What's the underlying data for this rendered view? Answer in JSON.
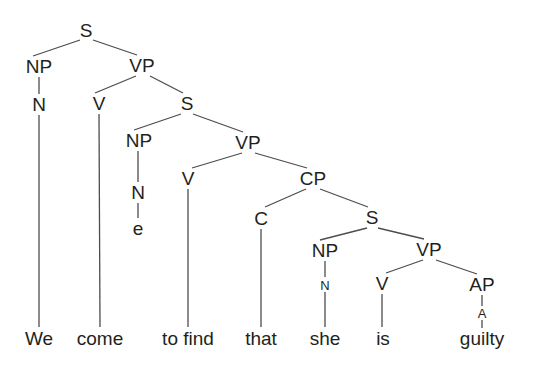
{
  "diagram": {
    "sentence": "We come to find that she is guilty",
    "background_color": "#ffffff",
    "line_color": "#4d4d4d",
    "text_color": "#231f20",
    "width": 534,
    "height": 371,
    "nodes": [
      {
        "id": "s-root",
        "label": "S",
        "x": 86,
        "y": 30,
        "kind": "category"
      },
      {
        "id": "np-1",
        "label": "NP",
        "x": 39,
        "y": 66,
        "kind": "category"
      },
      {
        "id": "vp-1",
        "label": "VP",
        "x": 142,
        "y": 65,
        "kind": "category"
      },
      {
        "id": "n-1",
        "label": "N",
        "x": 39,
        "y": 104,
        "kind": "category"
      },
      {
        "id": "v-1",
        "label": "V",
        "x": 99,
        "y": 103,
        "kind": "category"
      },
      {
        "id": "s-2",
        "label": "S",
        "x": 187,
        "y": 103,
        "kind": "category"
      },
      {
        "id": "np-2",
        "label": "NP",
        "x": 139,
        "y": 140,
        "kind": "category"
      },
      {
        "id": "vp-2",
        "label": "VP",
        "x": 248,
        "y": 142,
        "kind": "category"
      },
      {
        "id": "n-2",
        "label": "N",
        "x": 138,
        "y": 192,
        "kind": "category"
      },
      {
        "id": "v-2",
        "label": "V",
        "x": 188,
        "y": 178,
        "kind": "category"
      },
      {
        "id": "cp-1",
        "label": "CP",
        "x": 313,
        "y": 178,
        "kind": "category"
      },
      {
        "id": "c-1",
        "label": "C",
        "x": 261,
        "y": 218,
        "kind": "category"
      },
      {
        "id": "s-3",
        "label": "S",
        "x": 372,
        "y": 217,
        "kind": "category"
      },
      {
        "id": "np-3",
        "label": "NP",
        "x": 325,
        "y": 250,
        "kind": "category"
      },
      {
        "id": "vp-3",
        "label": "VP",
        "x": 429,
        "y": 249,
        "kind": "category"
      },
      {
        "id": "n-3",
        "label": "N",
        "x": 325,
        "y": 285,
        "kind": "category-small"
      },
      {
        "id": "v-3",
        "label": "V",
        "x": 382,
        "y": 283,
        "kind": "category"
      },
      {
        "id": "ap-1",
        "label": "AP",
        "x": 482,
        "y": 284,
        "kind": "category"
      },
      {
        "id": "a-1",
        "label": "A",
        "x": 482,
        "y": 313,
        "kind": "category-small"
      },
      {
        "id": "leaf-we",
        "label": "We",
        "x": 39,
        "y": 338,
        "kind": "terminal"
      },
      {
        "id": "leaf-come",
        "label": "come",
        "x": 100,
        "y": 338,
        "kind": "terminal"
      },
      {
        "id": "leaf-e",
        "label": "e",
        "x": 138,
        "y": 228,
        "kind": "terminal"
      },
      {
        "id": "leaf-tofind",
        "label": "to find",
        "x": 188,
        "y": 338,
        "kind": "terminal"
      },
      {
        "id": "leaf-that",
        "label": "that",
        "x": 261,
        "y": 338,
        "kind": "terminal"
      },
      {
        "id": "leaf-she",
        "label": "she",
        "x": 325,
        "y": 338,
        "kind": "terminal"
      },
      {
        "id": "leaf-is",
        "label": "is",
        "x": 383,
        "y": 338,
        "kind": "terminal"
      },
      {
        "id": "leaf-guilty",
        "label": "guilty",
        "x": 482,
        "y": 338,
        "kind": "terminal"
      }
    ],
    "edges": [
      {
        "from": "s-root",
        "to": "np-1",
        "x1": 80,
        "y1": 40,
        "x2": 33,
        "y2": 56
      },
      {
        "from": "s-root",
        "to": "vp-1",
        "x1": 93,
        "y1": 40,
        "x2": 137,
        "y2": 55
      },
      {
        "from": "np-1",
        "to": "n-1",
        "x1": 39,
        "y1": 77,
        "x2": 39,
        "y2": 94
      },
      {
        "from": "n-1",
        "to": "leaf-we",
        "x1": 39,
        "y1": 115,
        "x2": 39,
        "y2": 327
      },
      {
        "from": "vp-1",
        "to": "v-1",
        "x1": 136,
        "y1": 76,
        "x2": 95,
        "y2": 93
      },
      {
        "from": "vp-1",
        "to": "s-2",
        "x1": 150,
        "y1": 76,
        "x2": 183,
        "y2": 93
      },
      {
        "from": "v-1",
        "to": "leaf-come",
        "x1": 99,
        "y1": 114,
        "x2": 100,
        "y2": 327
      },
      {
        "from": "s-2",
        "to": "np-2",
        "x1": 181,
        "y1": 114,
        "x2": 134,
        "y2": 130
      },
      {
        "from": "s-2",
        "to": "vp-2",
        "x1": 193,
        "y1": 114,
        "x2": 243,
        "y2": 132
      },
      {
        "from": "np-2",
        "to": "n-2",
        "x1": 138,
        "y1": 151,
        "x2": 138,
        "y2": 182
      },
      {
        "from": "n-2",
        "to": "leaf-e",
        "x1": 138,
        "y1": 203,
        "x2": 138,
        "y2": 218
      },
      {
        "from": "vp-2",
        "to": "v-2",
        "x1": 242,
        "y1": 153,
        "x2": 192,
        "y2": 168
      },
      {
        "from": "vp-2",
        "to": "cp-1",
        "x1": 255,
        "y1": 153,
        "x2": 307,
        "y2": 168
      },
      {
        "from": "v-2",
        "to": "leaf-tofind",
        "x1": 188,
        "y1": 189,
        "x2": 188,
        "y2": 327
      },
      {
        "from": "cp-1",
        "to": "c-1",
        "x1": 306,
        "y1": 189,
        "x2": 265,
        "y2": 207
      },
      {
        "from": "cp-1",
        "to": "s-3",
        "x1": 320,
        "y1": 189,
        "x2": 368,
        "y2": 207
      },
      {
        "from": "c-1",
        "to": "leaf-that",
        "x1": 261,
        "y1": 229,
        "x2": 261,
        "y2": 327
      },
      {
        "from": "s-3",
        "to": "np-3",
        "x1": 367,
        "y1": 228,
        "x2": 320,
        "y2": 240
      },
      {
        "from": "s-3",
        "to": "vp-3",
        "x1": 378,
        "y1": 228,
        "x2": 424,
        "y2": 239
      },
      {
        "from": "np-3",
        "to": "n-3",
        "x1": 325,
        "y1": 261,
        "x2": 325,
        "y2": 277
      },
      {
        "from": "n-3",
        "to": "leaf-she",
        "x1": 325,
        "y1": 292,
        "x2": 325,
        "y2": 327
      },
      {
        "from": "vp-3",
        "to": "v-3",
        "x1": 423,
        "y1": 260,
        "x2": 386,
        "y2": 273
      },
      {
        "from": "vp-3",
        "to": "ap-1",
        "x1": 436,
        "y1": 260,
        "x2": 477,
        "y2": 274
      },
      {
        "from": "v-3",
        "to": "leaf-is",
        "x1": 382,
        "y1": 294,
        "x2": 382,
        "y2": 327
      },
      {
        "from": "ap-1",
        "to": "a-1",
        "x1": 482,
        "y1": 295,
        "x2": 482,
        "y2": 306
      },
      {
        "from": "a-1",
        "to": "leaf-guilty",
        "x1": 482,
        "y1": 320,
        "x2": 482,
        "y2": 328
      }
    ]
  }
}
